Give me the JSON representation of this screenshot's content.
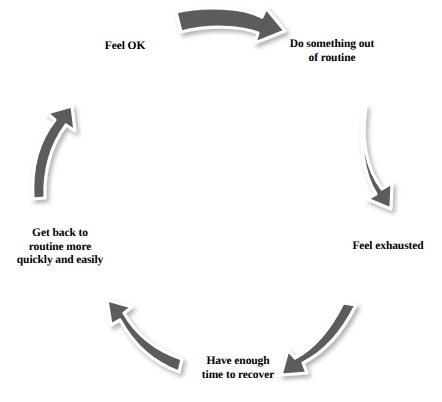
{
  "diagram": {
    "type": "cycle",
    "title": "",
    "palette": {
      "arrow_fill": "#5c5c5c",
      "arrow_outline": "#ffffff",
      "arrow_shadow": "#b8b8b8",
      "text": "#000000",
      "background": "#ffffff"
    },
    "steps": [
      {
        "id": "do-something",
        "label": "Do something out\nof routine",
        "position": "top-right"
      },
      {
        "id": "feel-exhausted",
        "label": "Feel exhausted",
        "position": "right"
      },
      {
        "id": "have-enough",
        "label": "Have enough\ntime to recover",
        "position": "bottom"
      },
      {
        "id": "get-back",
        "label": "Get back to\nroutine more\nquickly and easily",
        "position": "left"
      },
      {
        "id": "feel-ok",
        "label": "Feel OK",
        "position": "top-left"
      }
    ],
    "arrows": [
      {
        "id": "arrow-top",
        "from": "feel-ok",
        "to": "do-something",
        "direction": "clockwise-right"
      },
      {
        "id": "arrow-right",
        "from": "do-something",
        "to": "feel-exhausted",
        "direction": "clockwise-down"
      },
      {
        "id": "arrow-bottom-right",
        "from": "feel-exhausted",
        "to": "have-enough",
        "direction": "clockwise-down-left"
      },
      {
        "id": "arrow-bottom-left",
        "from": "have-enough",
        "to": "get-back",
        "direction": "clockwise-up-left"
      },
      {
        "id": "arrow-left",
        "from": "get-back",
        "to": "feel-ok",
        "direction": "clockwise-up"
      }
    ],
    "bottom_artifact_text": " "
  }
}
